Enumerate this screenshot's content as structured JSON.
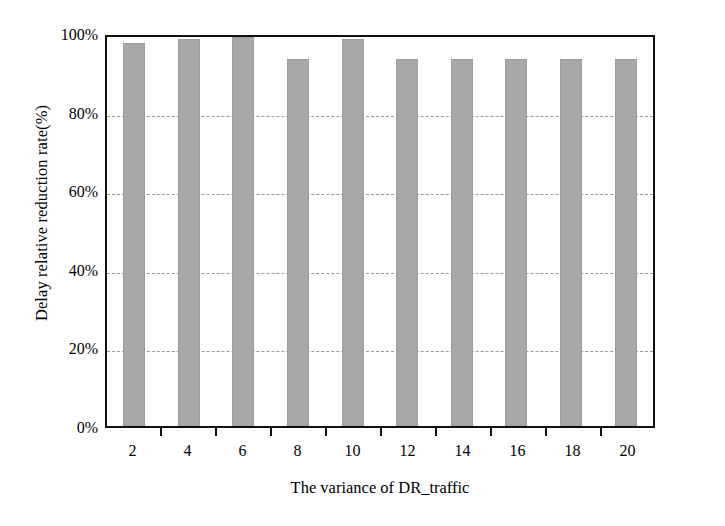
{
  "chart_data": {
    "type": "bar",
    "title": "",
    "xlabel": "The variance of DR_traffic",
    "ylabel": "Delay relative reduction rate(%)",
    "categories": [
      "2",
      "4",
      "6",
      "8",
      "10",
      "12",
      "14",
      "16",
      "18",
      "20"
    ],
    "values": [
      97.5,
      98.5,
      99.0,
      93.5,
      98.5,
      93.5,
      93.5,
      93.5,
      93.5,
      93.5
    ],
    "ylim": [
      0,
      100
    ],
    "yticks": [
      0,
      20,
      40,
      60,
      80,
      100
    ],
    "ytick_labels": [
      "0%",
      "20%",
      "40%",
      "60%",
      "80%",
      "100%"
    ],
    "gridlines": [
      20,
      40,
      60,
      80
    ],
    "grid": true,
    "legend": null,
    "legend_position": "none",
    "bar_color": "#a8a8a8",
    "axis_color": "#111111",
    "grid_color": "#9a9a9a",
    "background": "#ffffff"
  }
}
